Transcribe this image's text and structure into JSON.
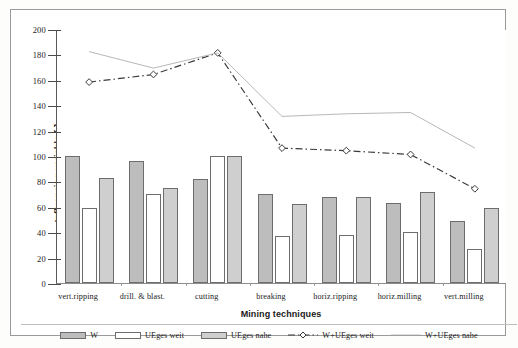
{
  "chart_data": {
    "type": "bar",
    "title": "",
    "xlabel": "Mining techniques",
    "ylabel": "Influencing variable [-]",
    "ylim": [
      0,
      200
    ],
    "ytick_step": 20,
    "yticks": [
      0,
      20,
      40,
      60,
      80,
      100,
      120,
      140,
      160,
      180,
      200
    ],
    "grid": false,
    "legend_position": "bottom",
    "categories": [
      "vert.ripping",
      "drill. & blast.",
      "cutting",
      "breaking",
      "horiz.ripping",
      "horiz.milling",
      "vert.milling"
    ],
    "bar_series": [
      {
        "name": "W",
        "style": "bar",
        "fill": "#bdbdbd",
        "values": [
          100,
          96,
          82,
          70,
          68,
          63,
          49
        ]
      },
      {
        "name": "UEges weit",
        "style": "bar",
        "fill": "#ffffff",
        "values": [
          59,
          70,
          100,
          37,
          38,
          40,
          27
        ]
      },
      {
        "name": "UEges nahe",
        "style": "bar",
        "fill": "#cfcfcf",
        "values": [
          83,
          75,
          100,
          62,
          68,
          72,
          59
        ]
      }
    ],
    "line_series": [
      {
        "name": "W+UEges weit",
        "style": "dash-dot-marker",
        "marker": "diamond-open",
        "color": "#3a3a3a",
        "values": [
          159,
          165,
          182,
          107,
          105,
          102,
          75
        ]
      },
      {
        "name": "W+UEges nahe",
        "style": "thin-solid",
        "marker": "none",
        "color": "#a5a5a5",
        "values": [
          183,
          170,
          182,
          132,
          134,
          135,
          107
        ]
      }
    ]
  },
  "legend": {
    "items": [
      {
        "label": "W",
        "kind": "swatch-w"
      },
      {
        "label": "UEges weit",
        "kind": "swatch-weit"
      },
      {
        "label": "UEges nahe",
        "kind": "swatch-nahe"
      },
      {
        "label": "W+UEges weit",
        "kind": "line-dashdot"
      },
      {
        "label": "W+UEges nahe",
        "kind": "line-thin"
      }
    ]
  },
  "colors": {
    "series_w": "#bdbdbd",
    "series_weit": "#ffffff",
    "series_nahe": "#cfcfcf",
    "line_weit": "#3a3a3a",
    "line_nahe": "#a5a5a5",
    "axis": "#5a5a5a",
    "frame": "#9a9a9a"
  }
}
